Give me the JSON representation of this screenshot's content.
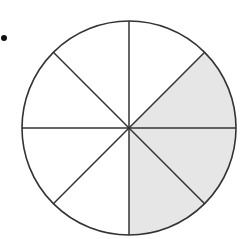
{
  "diagram": {
    "bullet": {
      "x": 4,
      "y": 38,
      "r": 3
    },
    "circle": {
      "cx": 129,
      "cy": 128,
      "r": 107,
      "stroke": "#333333",
      "fill": "#ffffff"
    },
    "sectors": 8,
    "shade_color": "#e6e6e6",
    "shaded_sectors": [
      {
        "name": "sector-right-upper",
        "start_deg": -45,
        "end_deg": 0
      },
      {
        "name": "sector-right-lower",
        "start_deg": 0,
        "end_deg": 45
      },
      {
        "name": "sector-bottom-right",
        "start_deg": 45,
        "end_deg": 90
      }
    ],
    "shaded_count": 3,
    "total_count": 8
  }
}
